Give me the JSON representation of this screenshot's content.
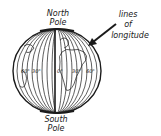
{
  "diagram": {
    "labels": {
      "north_pole_line1": "North",
      "north_pole_line2": "Pole",
      "south_pole_line1": "South",
      "south_pole_line2": "Pole",
      "callout_line1": "lines",
      "callout_line2": "of",
      "callout_line3": "longitude"
    },
    "meridian_labels": [
      "60°",
      "30°",
      "0°",
      "30°",
      "60°"
    ],
    "colors": {
      "ink": "#1a1a1a",
      "background": "#ffffff"
    }
  }
}
